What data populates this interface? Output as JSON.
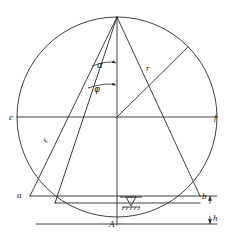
{
  "figure": {
    "stroke_color": "#2b2b2b",
    "background_color": "#ffffff"
  },
  "labels": {
    "apex": "",
    "left_diameter": "e",
    "right_diameter": "f",
    "chord_left_end": "a",
    "chord_right_end": "b",
    "bottom_point": "A",
    "radius_left": "r",
    "radius_right": "r",
    "height_dim": "h",
    "angle_alpha": "α",
    "angle_phi": "φ"
  },
  "geometry": {
    "center_x": 117,
    "center_y": 117,
    "radius": 100,
    "apex_x": 117,
    "apex_y": 17,
    "point_a_x": 30,
    "point_a_y": 196,
    "point_b_x": 200,
    "point_b_y": 196,
    "point_A_x": 117,
    "point_A_y": 225,
    "diameter_left_x": 17,
    "diameter_right_x": 217,
    "diameter_y": 117,
    "upper_right_x": 188,
    "upper_right_y": 47,
    "chord_inner_bottom_x": 55,
    "chord_inner_bottom_y": 202,
    "water_symbol_x": 131,
    "water_symbol_y": 200,
    "h_dim_x": 210,
    "h_top_y": 196,
    "h_bottom_y": 224
  },
  "icons": {
    "water_level": "water-level-triangle-icon",
    "arrowhead": "arrowhead-icon"
  }
}
